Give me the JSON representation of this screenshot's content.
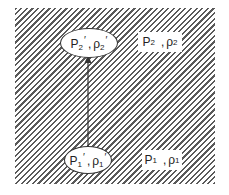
{
  "diagram": {
    "region": {
      "fill": "diagonal-hatch",
      "color": "#5a5a5a"
    },
    "states": [
      {
        "id": "state-2-prime",
        "symbol": "P",
        "sub": "2",
        "prime": "′",
        "sep": ",",
        "symbol2": "ρ",
        "sub2": "2",
        "prime2": "′",
        "enclosed": true
      },
      {
        "id": "state-2",
        "symbol": "P",
        "sub": "2",
        "prime": "",
        "sep": ",",
        "symbol2": "ρ",
        "sub2": "2",
        "prime2": "",
        "enclosed": false
      },
      {
        "id": "state-1-prime",
        "symbol": "P",
        "sub": "1",
        "prime": "′",
        "sep": ",",
        "symbol2": "ρ",
        "sub2": "1",
        "prime2": "′",
        "enclosed": true
      },
      {
        "id": "state-1",
        "symbol": "P",
        "sub": "1",
        "prime": "",
        "sep": ",",
        "symbol2": "ρ",
        "sub2": "1",
        "prime2": "",
        "enclosed": false
      }
    ],
    "arrow": {
      "from": "state-1-prime",
      "to": "state-2-prime",
      "color": "#333333"
    }
  }
}
